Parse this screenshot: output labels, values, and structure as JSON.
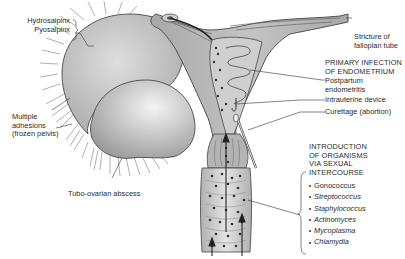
{
  "figure": {
    "labels": {
      "hydrosalpinx": "Hydrosalpinx",
      "pyosalpinx": "Pyosalpinx",
      "multiple_adhesions_1": "Multiple",
      "multiple_adhesions_2": "adhesions",
      "multiple_adhesions_3": "(frozen pelvis)",
      "tubo_ovarian": "Tubo-ovarian abscess",
      "stricture_1": "Stricture of",
      "stricture_2": "fallopian tube",
      "primary_1": "PRIMARY INFECTION",
      "primary_2": "OF ENDOMETRIUM",
      "postpartum_1": "Postpartum",
      "postpartum_2": "endometritis",
      "iud": "Intrauterine device",
      "curettage": "Curettage (abortion)",
      "intro_1": "INTRODUCTION",
      "intro_2": "OF ORGANISMS",
      "intro_3": "VIA SEXUAL",
      "intro_4": "INTERCOURSE"
    },
    "organisms": [
      {
        "name": "Gonococcus",
        "italic": false
      },
      {
        "name": "Streptococcus",
        "italic": true
      },
      {
        "name": "Staphylococcus",
        "italic": true
      },
      {
        "name": "Actinomyces",
        "italic": true
      },
      {
        "name": "Mycoplasma",
        "italic": true
      },
      {
        "name": "Chlamydia",
        "italic": true
      }
    ],
    "colors": {
      "tissue": "#b9b9b9",
      "tissue_light": "#d6d6d6",
      "outline": "#444444",
      "text": "#2a2a2a"
    }
  }
}
